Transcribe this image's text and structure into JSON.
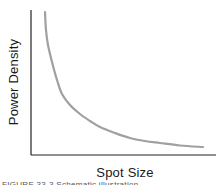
{
  "chart_data": {
    "type": "line",
    "title": "",
    "xlabel": "Spot Size",
    "ylabel": "Power Density",
    "grid": false,
    "legend": null,
    "x_ticks": [],
    "y_ticks": [],
    "series": [
      {
        "name": "Power Density vs Spot Size",
        "color": "#a0a0a0",
        "description": "Inverse (hyperbolic) relationship: power density decreases steeply as spot size increases, flattening toward the x-axis",
        "points_px": [
          [
            45,
            12
          ],
          [
            46,
            30
          ],
          [
            48,
            45
          ],
          [
            52,
            62
          ],
          [
            57,
            80
          ],
          [
            62,
            94
          ],
          [
            70,
            105
          ],
          [
            80,
            114
          ],
          [
            90,
            121
          ],
          [
            100,
            127
          ],
          [
            115,
            133
          ],
          [
            130,
            138
          ],
          [
            145,
            141
          ],
          [
            160,
            143
          ],
          [
            180,
            145.5
          ],
          [
            203,
            147
          ]
        ]
      }
    ],
    "axes": {
      "origin_px": [
        31,
        155
      ],
      "y_axis_top_px": 10,
      "x_axis_right_px": 216,
      "color": "#222222"
    }
  },
  "labels": {
    "x_axis": "Spot Size",
    "y_axis": "Power Density",
    "caption": "FIGURE 33-3 Schematic illustration..."
  }
}
